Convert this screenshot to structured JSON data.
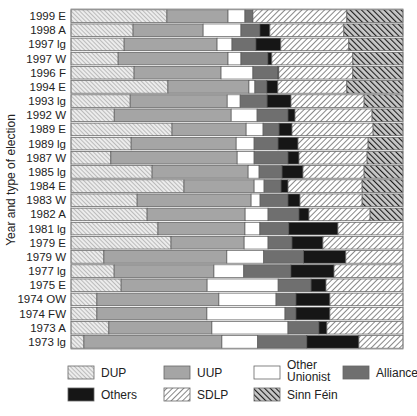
{
  "chart_data": {
    "type": "bar",
    "orientation": "horizontal",
    "stacked": true,
    "normalized": true,
    "title": "",
    "xlabel": "",
    "ylabel": "Year and type of election",
    "xlim": [
      0,
      100
    ],
    "unit": "percent of vote (estimated)",
    "categories": [
      "1999 E",
      "1998 A",
      "1997 lg",
      "1997 W",
      "1996 F",
      "1994 E",
      "1993 lg",
      "1992 W",
      "1989 E",
      "1989 lg",
      "1987 W",
      "1985 lg",
      "1984 E",
      "1983 W",
      "1982 A",
      "1981 lg",
      "1979 E",
      "1979 W",
      "1977 lg",
      "1975 E",
      "1974 OW",
      "1974 FW",
      "1973 A",
      "1973 lg"
    ],
    "series": [
      {
        "name": "DUP",
        "key": "dup",
        "values": [
          28.9,
          18.7,
          16.0,
          14.2,
          19.0,
          29.2,
          17.8,
          13.0,
          30.4,
          18.1,
          12.0,
          24.4,
          34.0,
          19.9,
          22.9,
          26.2,
          30.1,
          9.9,
          13.0,
          15.1,
          7.8,
          7.8,
          11.4,
          3.9
        ]
      },
      {
        "name": "UUP",
        "key": "uup",
        "values": [
          18.4,
          21.1,
          28.0,
          33.1,
          26.2,
          24.4,
          29.2,
          35.2,
          22.3,
          31.6,
          38.0,
          28.9,
          21.1,
          34.3,
          29.5,
          26.2,
          22.0,
          37.0,
          30.1,
          25.9,
          36.7,
          33.1,
          31.0,
          41.6
        ]
      },
      {
        "name": "Other Unionist",
        "key": "ou",
        "values": [
          5.1,
          11.4,
          4.5,
          3.9,
          9.6,
          1.8,
          3.9,
          7.8,
          5.1,
          5.4,
          5.1,
          3.3,
          3.0,
          2.7,
          6.9,
          4.5,
          7.2,
          11.1,
          9.0,
          21.4,
          17.2,
          23.5,
          22.9,
          10.8
        ]
      },
      {
        "name": "Alliance",
        "key": "alliance",
        "values": [
          2.4,
          5.7,
          7.2,
          8.1,
          7.5,
          3.6,
          8.1,
          9.3,
          4.8,
          7.2,
          10.2,
          6.9,
          5.1,
          8.4,
          9.3,
          8.7,
          7.2,
          12.0,
          14.2,
          9.9,
          6.0,
          3.3,
          9.3,
          14.8
        ]
      },
      {
        "name": "Others",
        "key": "others",
        "values": [
          0.0,
          3.0,
          7.5,
          1.2,
          0.3,
          3.3,
          7.2,
          2.1,
          3.9,
          6.0,
          3.3,
          6.3,
          2.1,
          3.6,
          3.0,
          14.8,
          9.3,
          12.7,
          13.0,
          4.5,
          10.2,
          10.2,
          2.4,
          15.7
        ]
      },
      {
        "name": "SDLP",
        "key": "sdlp",
        "values": [
          28.3,
          22.3,
          20.5,
          24.4,
          22.3,
          20.8,
          22.0,
          23.2,
          24.4,
          21.1,
          20.5,
          18.4,
          22.3,
          18.7,
          18.4,
          19.6,
          24.1,
          17.2,
          20.8,
          23.2,
          22.0,
          22.0,
          22.9,
          13.3
        ]
      },
      {
        "name": "Sinn Féin",
        "key": "sf",
        "values": [
          16.9,
          17.8,
          16.3,
          15.1,
          15.1,
          16.9,
          11.7,
          9.3,
          9.0,
          10.5,
          10.8,
          11.7,
          12.3,
          12.3,
          9.9,
          0,
          0,
          0,
          0,
          0,
          0,
          0,
          0,
          0
        ]
      }
    ],
    "legend": {
      "placement": "bottom",
      "entries": [
        {
          "label": "DUP",
          "key": "dup"
        },
        {
          "label": "UUP",
          "key": "uup"
        },
        {
          "label_line1": "Other",
          "label_line2": "Unionist",
          "key": "ou"
        },
        {
          "label": "Alliance",
          "key": "alliance"
        },
        {
          "label": "Others",
          "key": "others"
        },
        {
          "label": "SDLP",
          "key": "sdlp"
        },
        {
          "label": "Sinn Féin",
          "key": "sf"
        }
      ]
    },
    "grid": false,
    "colors": {
      "dup": "#e2e2e2",
      "uup": "#a5a5a5",
      "ou": "#ffffff",
      "alliance": "#6f6f6f",
      "others": "#161616",
      "sdlp": "#f4f4f4",
      "sf": "#3a3a3a"
    }
  }
}
